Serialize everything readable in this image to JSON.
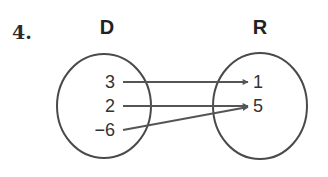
{
  "problem": {
    "number": "4."
  },
  "domain_set": {
    "label": "D",
    "values": [
      "3",
      "2",
      "−6"
    ]
  },
  "range_set": {
    "label": "R",
    "values": [
      "1",
      "5"
    ]
  },
  "mapping": [
    {
      "from": "3",
      "to": "1"
    },
    {
      "from": "2",
      "to": "5"
    },
    {
      "from": "−6",
      "to": "5"
    }
  ],
  "colors": {
    "stroke": "#4a4a4a",
    "arrow": "#555555",
    "text": "#2b2b2b"
  }
}
